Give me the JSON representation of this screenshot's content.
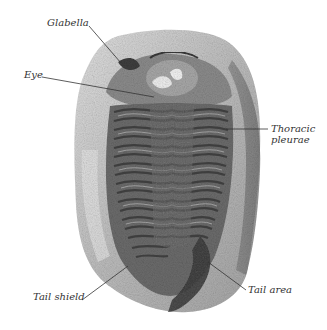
{
  "figure": {
    "labels": [
      {
        "id": "glabella",
        "text": "Glabella"
      },
      {
        "id": "eye",
        "text": "Eye"
      },
      {
        "id": "thoracic-pleurae",
        "line1": "Thoracic",
        "line2": "pleurae"
      },
      {
        "id": "tail-shield",
        "text": "Tail shield"
      },
      {
        "id": "tail-area",
        "text": "Tail area"
      }
    ]
  },
  "colors": {
    "background": "#ffffff",
    "rock_light": "#cfcfcf",
    "rock_mid": "#9a9a9a",
    "fossil_dark": "#4a4a4a",
    "leader_line": "#333333",
    "label_text": "#333333"
  }
}
